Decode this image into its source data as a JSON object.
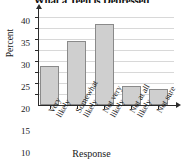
{
  "chart_data": {
    "type": "bar",
    "title": "What a Teen is Depressed",
    "xlabel": "Response",
    "ylabel": "Percent",
    "categories": [
      "Very likely",
      "Somewhat likely",
      "Not very likely",
      "Not at all likely",
      "Not sure"
    ],
    "category_lines": [
      [
        "Very",
        "likely"
      ],
      [
        "Somewhat",
        "likely"
      ],
      [
        "Not very",
        "likely"
      ],
      [
        "Not at all",
        "likely"
      ],
      [
        "Not sure",
        ""
      ]
    ],
    "values": [
      18,
      29,
      37,
      8.5,
      7.5
    ],
    "ylim": [
      0,
      42
    ],
    "yticks": [
      5,
      10,
      15,
      20,
      25,
      30,
      35,
      40
    ],
    "ytick_labels": [
      "5",
      "10",
      "15",
      "20",
      "25",
      "30",
      "35",
      "40"
    ],
    "grid": true,
    "legend": false,
    "bar_fill_color": "#cfcfcf",
    "bar_edge_color": "#8a8a8a",
    "axis_color": "#2b2b2b",
    "gridline_color": "#d8d8d8"
  }
}
